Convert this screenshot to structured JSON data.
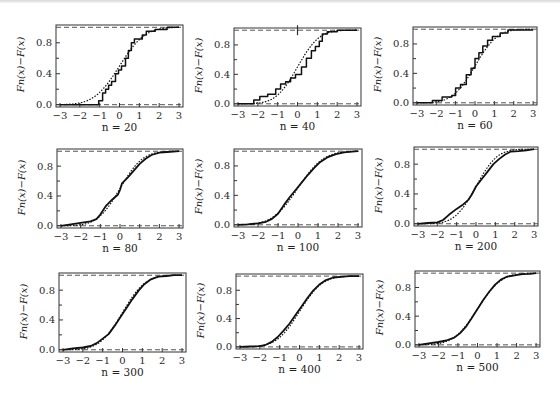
{
  "figure": {
    "ylabel": "Fn(x) − F(x)",
    "xticks": [
      -3,
      -2,
      -1,
      0,
      1,
      2,
      3
    ],
    "xtick_labels": [
      "−3",
      "−2",
      "−1",
      "0",
      "1",
      "2",
      "3"
    ],
    "yticks_major": [
      0.0,
      0.4,
      0.8
    ],
    "ytick_labels": [
      "0.0",
      "0.4",
      "0.8"
    ],
    "yticks_minor": [
      0.2,
      0.6
    ],
    "xlim": [
      -3.2,
      3.2
    ],
    "ylim": [
      -0.03,
      1.03
    ],
    "reference_lines": [
      0,
      1
    ],
    "colors": {
      "axis": "#333333",
      "curve": "#111111",
      "dashed": "#555555",
      "frame_bg": "#ffffff"
    }
  },
  "chart_data": [
    {
      "type": "line",
      "title": "",
      "panel_label": "n = 20",
      "n": 20,
      "xlabel": "n = 20",
      "ylabel": "Fn(x)−F(x)",
      "xlim": [
        -3,
        3
      ],
      "ylim": [
        0,
        1
      ],
      "grid": false,
      "series": [
        {
          "name": "empirical CDF (step)",
          "style": "solid",
          "step": true,
          "x": [
            -3.0,
            -1.05,
            -1.05,
            -0.85,
            -0.85,
            -0.7,
            -0.7,
            -0.55,
            -0.55,
            -0.4,
            -0.4,
            -0.2,
            -0.2,
            -0.05,
            -0.05,
            0.1,
            0.1,
            0.3,
            0.3,
            0.45,
            0.45,
            0.6,
            0.6,
            0.75,
            0.75,
            1.15,
            1.15,
            1.35,
            1.35,
            1.8,
            1.8,
            2.4,
            2.4,
            3.0
          ],
          "y": [
            0.0,
            0.0,
            0.05,
            0.05,
            0.15,
            0.15,
            0.2,
            0.2,
            0.25,
            0.25,
            0.3,
            0.3,
            0.4,
            0.4,
            0.45,
            0.45,
            0.5,
            0.5,
            0.6,
            0.6,
            0.7,
            0.7,
            0.8,
            0.8,
            0.85,
            0.85,
            0.9,
            0.9,
            0.95,
            0.95,
            0.97,
            0.97,
            1.0,
            1.0
          ]
        },
        {
          "name": "theoretical CDF",
          "style": "dotted",
          "step": false,
          "curve": "normal",
          "mu": 0.0,
          "sigma": 1.0
        }
      ]
    },
    {
      "type": "line",
      "panel_label": "n = 40",
      "n": 40,
      "xlabel": "n = 40",
      "ylabel": "Fn(x)−F(x)",
      "xlim": [
        -3,
        3
      ],
      "ylim": [
        0,
        1
      ],
      "grid": false,
      "annotations": [
        {
          "type": "vertical-mark",
          "x": 0.0,
          "y": 1.0
        }
      ],
      "series": [
        {
          "name": "empirical CDF (step)",
          "style": "solid",
          "step": true,
          "x": [
            -3.0,
            -2.2,
            -2.2,
            -1.9,
            -1.9,
            -1.5,
            -1.5,
            -1.1,
            -1.1,
            -0.85,
            -0.85,
            -0.6,
            -0.6,
            -0.35,
            -0.35,
            -0.1,
            -0.1,
            0.2,
            0.2,
            0.45,
            0.45,
            0.7,
            0.7,
            0.9,
            0.9,
            1.1,
            1.1,
            1.25,
            1.25,
            1.5,
            1.5,
            2.0,
            2.0,
            3.0
          ],
          "y": [
            0.0,
            0.0,
            0.05,
            0.05,
            0.1,
            0.1,
            0.13,
            0.13,
            0.2,
            0.2,
            0.27,
            0.27,
            0.3,
            0.3,
            0.35,
            0.35,
            0.4,
            0.4,
            0.5,
            0.5,
            0.62,
            0.62,
            0.72,
            0.72,
            0.78,
            0.78,
            0.85,
            0.85,
            0.95,
            0.95,
            0.98,
            0.98,
            1.0,
            1.0
          ]
        },
        {
          "name": "theoretical CDF",
          "style": "dotted",
          "step": false,
          "curve": "normal",
          "mu": 0.0,
          "sigma": 0.85
        }
      ]
    },
    {
      "type": "line",
      "panel_label": "n = 60",
      "n": 60,
      "xlabel": "n = 60",
      "ylabel": "Fn(x)−F(x)",
      "xlim": [
        -3,
        3
      ],
      "ylim": [
        0,
        1
      ],
      "grid": false,
      "series": [
        {
          "name": "empirical CDF (step)",
          "style": "solid",
          "step": true,
          "x": [
            -3.0,
            -2.2,
            -2.2,
            -1.7,
            -1.7,
            -1.2,
            -1.2,
            -1.0,
            -1.0,
            -0.75,
            -0.75,
            -0.45,
            -0.45,
            -0.2,
            -0.2,
            0.0,
            0.0,
            0.2,
            0.2,
            0.4,
            0.4,
            0.65,
            0.65,
            0.9,
            0.9,
            1.3,
            1.3,
            1.7,
            1.7,
            3.0
          ],
          "y": [
            0.0,
            0.0,
            0.03,
            0.03,
            0.08,
            0.08,
            0.1,
            0.1,
            0.2,
            0.2,
            0.25,
            0.25,
            0.38,
            0.38,
            0.47,
            0.47,
            0.6,
            0.6,
            0.68,
            0.68,
            0.77,
            0.77,
            0.85,
            0.85,
            0.9,
            0.9,
            0.95,
            0.95,
            0.99,
            0.99
          ]
        },
        {
          "name": "theoretical CDF",
          "style": "dotted",
          "step": false,
          "curve": "normal",
          "mu": 0.0,
          "sigma": 0.9
        }
      ]
    },
    {
      "type": "line",
      "panel_label": "n = 80",
      "n": 80,
      "xlabel": "n = 80",
      "ylabel": "Fn(x)−F(x)",
      "xlim": [
        -3,
        3
      ],
      "ylim": [
        0,
        1
      ],
      "grid": false,
      "series": [
        {
          "name": "empirical CDF",
          "style": "solid",
          "step": false,
          "x": [
            -3.0,
            -2.5,
            -2.0,
            -1.5,
            -1.2,
            -1.0,
            -0.7,
            -0.4,
            -0.1,
            0.0,
            0.1,
            0.4,
            0.7,
            1.0,
            1.3,
            1.6,
            2.0,
            2.4,
            3.0
          ],
          "y": [
            0.0,
            0.02,
            0.04,
            0.06,
            0.09,
            0.15,
            0.27,
            0.35,
            0.42,
            0.48,
            0.57,
            0.65,
            0.74,
            0.83,
            0.9,
            0.95,
            0.98,
            0.99,
            1.0
          ]
        },
        {
          "name": "theoretical CDF",
          "style": "dotted",
          "step": false,
          "curve": "normal",
          "mu": 0.0,
          "sigma": 0.9
        }
      ]
    },
    {
      "type": "line",
      "panel_label": "n = 100",
      "n": 100,
      "xlabel": "n = 100",
      "ylabel": "Fn(x)−F(x)",
      "xlim": [
        -3,
        3
      ],
      "ylim": [
        0,
        1
      ],
      "grid": false,
      "series": [
        {
          "name": "empirical CDF",
          "style": "solid",
          "step": false,
          "x": [
            -3.0,
            -2.5,
            -2.0,
            -1.6,
            -1.3,
            -1.0,
            -0.7,
            -0.4,
            -0.1,
            0.2,
            0.5,
            0.8,
            1.1,
            1.5,
            1.9,
            2.3,
            2.7,
            3.0
          ],
          "y": [
            0.0,
            0.005,
            0.02,
            0.04,
            0.08,
            0.15,
            0.27,
            0.38,
            0.48,
            0.58,
            0.68,
            0.77,
            0.85,
            0.92,
            0.96,
            0.985,
            0.995,
            1.0
          ]
        },
        {
          "name": "theoretical CDF",
          "style": "dotted",
          "step": false,
          "curve": "normal",
          "mu": 0.0,
          "sigma": 1.0
        }
      ]
    },
    {
      "type": "line",
      "panel_label": "n = 200",
      "n": 200,
      "xlabel": "n = 200",
      "ylabel": "Fn(x)−F(x)",
      "xlim": [
        -3,
        3
      ],
      "ylim": [
        0,
        1
      ],
      "grid": false,
      "series": [
        {
          "name": "empirical CDF",
          "style": "solid",
          "step": false,
          "x": [
            -3.0,
            -2.5,
            -2.0,
            -1.7,
            -1.4,
            -1.0,
            -0.7,
            -0.4,
            -0.2,
            0.0,
            0.3,
            0.6,
            0.9,
            1.2,
            1.5,
            1.8,
            2.2,
            2.6,
            3.0
          ],
          "y": [
            0.0,
            0.01,
            0.02,
            0.05,
            0.12,
            0.2,
            0.25,
            0.32,
            0.4,
            0.5,
            0.6,
            0.7,
            0.8,
            0.87,
            0.93,
            0.97,
            0.975,
            0.985,
            1.0
          ]
        },
        {
          "name": "theoretical CDF",
          "style": "dotted",
          "step": false,
          "curve": "normal",
          "mu": 0.0,
          "sigma": 0.85
        }
      ]
    },
    {
      "type": "line",
      "panel_label": "n = 300",
      "n": 300,
      "xlabel": "n = 300",
      "ylabel": "Fn(x)−F(x)",
      "xlim": [
        -3,
        3
      ],
      "ylim": [
        0,
        1
      ],
      "grid": false,
      "series": [
        {
          "name": "empirical CDF",
          "style": "solid",
          "step": false,
          "x": [
            -3.0,
            -2.5,
            -2.0,
            -1.6,
            -1.3,
            -1.0,
            -0.7,
            -0.4,
            -0.1,
            0.2,
            0.5,
            0.8,
            1.1,
            1.4,
            1.8,
            2.2,
            2.6,
            3.0
          ],
          "y": [
            0.0,
            0.02,
            0.03,
            0.05,
            0.09,
            0.15,
            0.21,
            0.32,
            0.44,
            0.56,
            0.68,
            0.79,
            0.88,
            0.94,
            0.98,
            0.99,
            1.0,
            1.0
          ]
        },
        {
          "name": "theoretical CDF",
          "style": "dotted",
          "step": false,
          "curve": "normal",
          "mu": 0.0,
          "sigma": 0.9
        }
      ]
    },
    {
      "type": "line",
      "panel_label": "n = 400",
      "n": 400,
      "xlabel": "n = 400",
      "ylabel": "Fn(x)−F(x)",
      "xlim": [
        -3,
        3
      ],
      "ylim": [
        0,
        1
      ],
      "grid": false,
      "series": [
        {
          "name": "empirical CDF",
          "style": "solid",
          "step": false,
          "x": [
            -3.0,
            -2.5,
            -2.0,
            -1.7,
            -1.4,
            -1.1,
            -0.8,
            -0.5,
            -0.2,
            0.1,
            0.4,
            0.7,
            1.0,
            1.3,
            1.7,
            2.1,
            2.5,
            3.0
          ],
          "y": [
            0.0,
            0.005,
            0.01,
            0.03,
            0.07,
            0.14,
            0.23,
            0.33,
            0.45,
            0.57,
            0.69,
            0.8,
            0.88,
            0.94,
            0.98,
            0.99,
            1.0,
            1.0
          ]
        },
        {
          "name": "theoretical CDF",
          "style": "dotted",
          "step": false,
          "curve": "normal",
          "mu": 0.0,
          "sigma": 0.9
        }
      ]
    },
    {
      "type": "line",
      "panel_label": "n = 500",
      "n": 500,
      "xlabel": "n = 500",
      "ylabel": "Fn(x)−F(x)",
      "xlim": [
        -3,
        3
      ],
      "ylim": [
        0,
        1
      ],
      "grid": false,
      "series": [
        {
          "name": "empirical CDF",
          "style": "solid",
          "step": false,
          "x": [
            -3.0,
            -2.5,
            -2.0,
            -1.6,
            -1.2,
            -0.9,
            -0.6,
            -0.3,
            0.0,
            0.3,
            0.6,
            0.9,
            1.2,
            1.5,
            1.9,
            2.3,
            2.7,
            3.0
          ],
          "y": [
            0.0,
            0.02,
            0.04,
            0.06,
            0.1,
            0.16,
            0.25,
            0.37,
            0.5,
            0.63,
            0.74,
            0.84,
            0.91,
            0.95,
            0.97,
            0.985,
            0.99,
            1.0
          ]
        },
        {
          "name": "theoretical CDF",
          "style": "dotted",
          "step": false,
          "curve": "normal",
          "mu": 0.0,
          "sigma": 0.95
        }
      ]
    }
  ],
  "layout": {
    "panels": [
      {
        "frame": [
          56,
          25,
          183,
          107
        ]
      },
      {
        "frame": [
          234,
          28,
          361,
          106
        ]
      },
      {
        "frame": [
          413,
          27,
          537,
          105
        ]
      },
      {
        "frame": [
          57,
          149,
          183,
          228
        ]
      },
      {
        "frame": [
          234,
          149,
          362,
          227
        ]
      },
      {
        "frame": [
          414,
          147,
          538,
          226
        ]
      },
      {
        "frame": [
          59,
          273,
          186,
          352
        ]
      },
      {
        "frame": [
          236,
          274,
          363,
          349
        ]
      },
      {
        "frame": [
          415,
          271,
          540,
          347
        ]
      }
    ]
  }
}
